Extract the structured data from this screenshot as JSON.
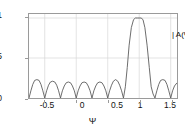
{
  "chart_data": {
    "type": "line",
    "title": "",
    "subtitle": "",
    "xlabel": "Ψ",
    "ylabel": "",
    "annotation": "| A(Ψ) |",
    "grid": true,
    "legend_position": "inside-top-right",
    "xlim": [
      -0.75,
      1.6
    ],
    "ylim": [
      0,
      1.05
    ],
    "xticks": [
      -0.5,
      0,
      0.5,
      1,
      1.5
    ],
    "xticklabels": [
      "-0.5",
      "0",
      "0.5",
      "1",
      "1.5"
    ],
    "yticks": [
      0,
      0.5,
      1
    ],
    "yticklabels": [
      "0",
      "0.5",
      "1"
    ],
    "line_color": "#5a5a5a",
    "grid_color": "#d6d6d6",
    "axis_color": "#9a9a9a",
    "series": [
      {
        "name": "| A(Ψ) |",
        "description": "Array factor magnitude, Dirichlet kernel, N = 8 elements, main beam steered to Ψ = 1",
        "main_lobe_center": 1.0,
        "main_lobe_peak": 1.0,
        "null_spacing": 0.25,
        "sidelobe_peak": 0.22,
        "x": [
          -0.75,
          -0.72,
          -0.69,
          -0.66,
          -0.625,
          -0.59,
          -0.56,
          -0.53,
          -0.5,
          -0.47,
          -0.44,
          -0.41,
          -0.375,
          -0.34,
          -0.31,
          -0.28,
          -0.25,
          -0.22,
          -0.19,
          -0.16,
          -0.125,
          -0.09,
          -0.06,
          -0.03,
          0,
          0.03,
          0.06,
          0.09,
          0.125,
          0.16,
          0.19,
          0.22,
          0.25,
          0.28,
          0.31,
          0.34,
          0.375,
          0.41,
          0.44,
          0.47,
          0.5,
          0.53,
          0.56,
          0.59,
          0.625,
          0.66,
          0.69,
          0.72,
          0.75,
          0.78,
          0.81,
          0.84,
          0.875,
          0.91,
          0.94,
          0.97,
          1,
          1.03,
          1.06,
          1.09,
          1.125,
          1.16,
          1.19,
          1.22,
          1.25,
          1.28,
          1.31,
          1.34,
          1.375,
          1.41,
          1.44,
          1.47,
          1.5,
          1.53,
          1.56,
          1.6
        ],
        "y": [
          0,
          0.09,
          0.17,
          0.22,
          0.23,
          0.22,
          0.17,
          0.09,
          0,
          0.09,
          0.16,
          0.2,
          0.21,
          0.2,
          0.16,
          0.09,
          0,
          0.09,
          0.15,
          0.19,
          0.2,
          0.19,
          0.15,
          0.09,
          0,
          0.09,
          0.15,
          0.19,
          0.2,
          0.19,
          0.15,
          0.09,
          0,
          0.09,
          0.15,
          0.19,
          0.2,
          0.19,
          0.15,
          0.09,
          0,
          0.09,
          0.16,
          0.21,
          0.23,
          0.21,
          0.16,
          0.09,
          0,
          0.14,
          0.38,
          0.66,
          0.88,
          0.98,
          1.0,
          1.0,
          1.0,
          1.0,
          0.98,
          0.88,
          0.66,
          0.38,
          0.14,
          0.05,
          0,
          0.09,
          0.17,
          0.22,
          0.23,
          0.22,
          0.17,
          0.09,
          0,
          0.09,
          0.15,
          0.19
        ]
      }
    ]
  }
}
